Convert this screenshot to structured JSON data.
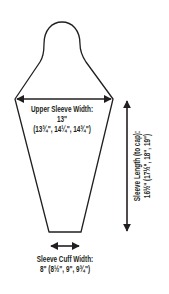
{
  "diagram": {
    "type": "sleeve schematic",
    "upper_sleeve_width": {
      "label": "Upper Sleeve Width:",
      "value": "13\"",
      "sizes": "(13¾\", 14¼\", 14¾\")"
    },
    "sleeve_length": {
      "label_line1": "Sleeve Length (to cap):",
      "label_line2": "16½\" (17½\", 18\", 19\")"
    },
    "sleeve_cuff_width": {
      "label": "Sleeve Cuff Width:",
      "value": "8\" (8½\", 9\", 9¾\")"
    },
    "colors": {
      "line": "#231f20",
      "background": "#ffffff"
    }
  }
}
